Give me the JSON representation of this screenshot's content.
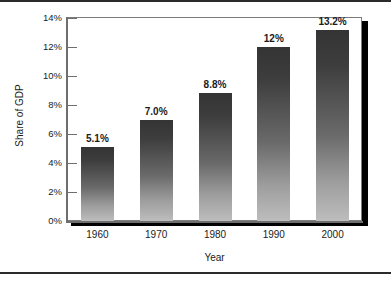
{
  "chart_data": {
    "type": "bar",
    "title": "",
    "subtitle": "",
    "categories": [
      "1960",
      "1970",
      "1980",
      "1990",
      "2000"
    ],
    "values": [
      5.1,
      7.0,
      8.8,
      12.0,
      13.2
    ],
    "value_labels": [
      "5.1%",
      "7.0%",
      "8.8%",
      "12%",
      "13.2%"
    ],
    "xlabel": "Year",
    "ylabel": "Share of GDP",
    "ylim": [
      0,
      14
    ],
    "ytick_values": [
      0,
      2,
      4,
      6,
      8,
      10,
      12,
      14
    ],
    "ytick_labels": [
      "0%",
      "2%",
      "4%",
      "6%",
      "8%",
      "10%",
      "12%",
      "14%"
    ],
    "grid": false,
    "legend": false,
    "legend_position": "none",
    "series": [
      {
        "name": "Share of GDP",
        "values": [
          5.1,
          7.0,
          8.8,
          12.0,
          13.2
        ]
      }
    ],
    "colors": {
      "bar_top": "#343434",
      "bar_bottom": "#bdbdbd",
      "axis": "#6e6e6e",
      "frame": "#7c7c7c",
      "shadow": "#000000",
      "text": "#1b1b1b",
      "background": "#ffffff"
    }
  }
}
